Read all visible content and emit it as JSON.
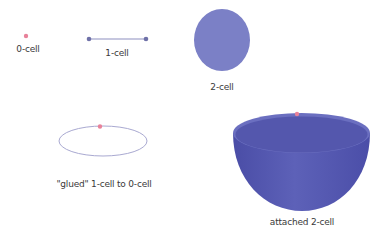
{
  "diagram": {
    "colors": {
      "point": "#e8829a",
      "segment": "#8e8fbf",
      "segment_endpoints": "#6f71a8",
      "disk": "#7b80c6",
      "loop": "#a9a9d1",
      "bowl": "#5558b0",
      "bowl_rim": "#6b6fc0",
      "text": "#3a3a3a"
    },
    "items": [
      {
        "id": "0-cell",
        "label": "0-cell"
      },
      {
        "id": "1-cell",
        "label": "1-cell"
      },
      {
        "id": "2-cell",
        "label": "2-cell"
      },
      {
        "id": "glued",
        "label": "\"glued\" 1-cell to 0-cell"
      },
      {
        "id": "attached",
        "label": "attached 2-cell"
      }
    ]
  }
}
